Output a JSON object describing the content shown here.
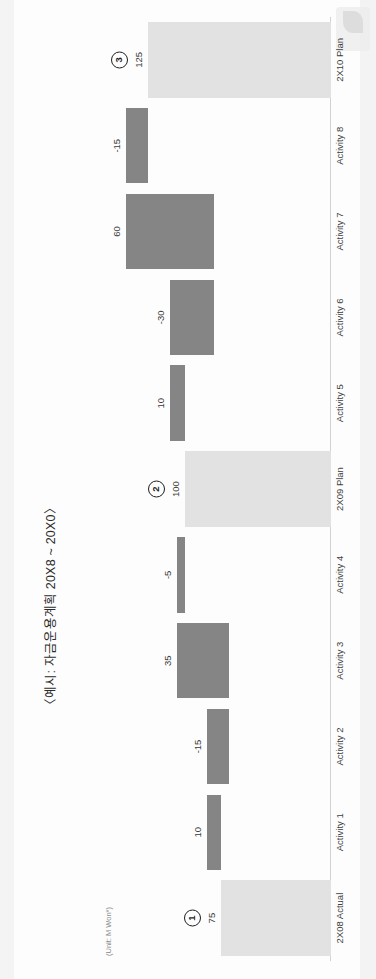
{
  "document": {
    "title": "〈예시: 자금운용계획 20X8 ~ 20X0〉",
    "unit_note": "(Unit: M Won*)"
  },
  "colors": {
    "total_bar": "#e2e2e2",
    "delta_bar": "#858585",
    "baseline": "#d2d2d2",
    "text": "#3a3a3a",
    "page_background": "#ffffff"
  },
  "chart_data": {
    "type": "bar",
    "chart_subtype": "waterfall",
    "title": "〈예시: 자금운용계획 20X8 ~ 20X0〉",
    "xlabel": "",
    "ylabel": "",
    "unit": "(Unit: M Won*)",
    "grid": false,
    "legend": "none",
    "ylim": [
      0,
      140
    ],
    "categories": [
      "2X08 Actual",
      "Activity 1",
      "Activity 2",
      "Activity 3",
      "Activity 4",
      "2X09 Plan",
      "Activity 5",
      "Activity 6",
      "Activity 7",
      "Activity 8",
      "2X10 Plan"
    ],
    "values": [
      75,
      10,
      -15,
      35,
      -5,
      100,
      10,
      -30,
      60,
      -15,
      125
    ],
    "value_labels": [
      "75",
      "10",
      "-15",
      "35",
      "-5",
      "100",
      "10",
      "-30",
      "60",
      "-15",
      "125"
    ],
    "bar_kinds": [
      "total",
      "delta",
      "delta",
      "delta",
      "delta",
      "total",
      "delta",
      "delta",
      "delta",
      "delta",
      "total"
    ],
    "cumulative_base": [
      0,
      75,
      70,
      70,
      100,
      0,
      100,
      80,
      80,
      125,
      0
    ],
    "cumulative_top": [
      75,
      85,
      85,
      105,
      105,
      100,
      110,
      110,
      140,
      140,
      125
    ],
    "annotations": [
      {
        "label": "1",
        "category": "2X08 Actual"
      },
      {
        "label": "2",
        "category": "2X09 Plan"
      },
      {
        "label": "3",
        "category": "2X10 Plan"
      }
    ]
  }
}
